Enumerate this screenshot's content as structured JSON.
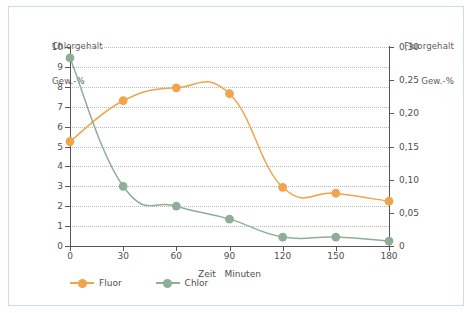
{
  "figure": {
    "frame_border_color": "#c8dfea",
    "background": "#ffffff"
  },
  "chart_data": {
    "type": "line",
    "title": "",
    "xlabel": "Zeit   Minuten",
    "ylabel": "Chlorgehalt\nGew.-%",
    "y2label": "Fluorgehalt\nGew.-%",
    "x": [
      0,
      30,
      60,
      90,
      120,
      150,
      180
    ],
    "xlim": [
      0,
      180
    ],
    "xticks": [
      "0",
      "30",
      "60",
      "90",
      "120",
      "150",
      "180"
    ],
    "ylim": [
      0,
      10
    ],
    "yticks": [
      "0",
      "1",
      "2",
      "3",
      "4",
      "5",
      "6",
      "7",
      "8",
      "9",
      "10"
    ],
    "y2lim": [
      0,
      0.3
    ],
    "y2ticks": [
      "0",
      "0,05",
      "0,10",
      "0,15",
      "0,20",
      "0,25",
      "0,30"
    ],
    "grid": true,
    "legend_position": "below-left",
    "series": [
      {
        "name": "Fluor",
        "axis": "right",
        "color": "#f0a44c",
        "values_right_axis": [
          0.157,
          0.219,
          0.238,
          0.229,
          0.088,
          0.079,
          0.067
        ],
        "values_left_scale": [
          5.25,
          7.3,
          7.95,
          7.65,
          2.95,
          2.65,
          2.25
        ]
      },
      {
        "name": "Chlor",
        "axis": "left",
        "color": "#8fae96",
        "values": [
          9.45,
          3.0,
          2.0,
          1.35,
          0.45,
          0.45,
          0.25
        ]
      }
    ]
  },
  "axis_titles": {
    "left_line1": "Chlorgehalt",
    "left_line2": "Gew.-%",
    "right_line1": "Fluorgehalt",
    "right_line2": "Gew.-%"
  },
  "legend": {
    "items": [
      {
        "label": "Fluor",
        "color": "#f0a44c"
      },
      {
        "label": "Chlor",
        "color": "#8fae96"
      }
    ]
  }
}
